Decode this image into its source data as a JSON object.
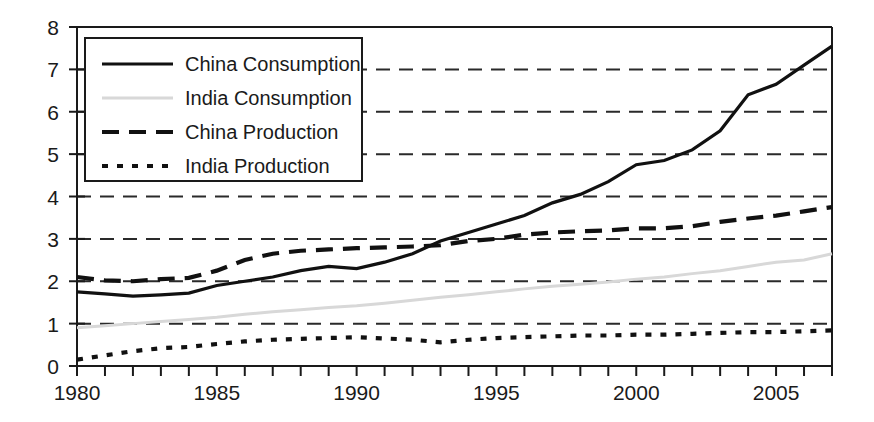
{
  "chart_data": {
    "type": "line",
    "title": "",
    "xlabel": "",
    "ylabel": "",
    "xlim": [
      1980,
      2007
    ],
    "ylim": [
      0,
      8
    ],
    "yticks": [
      0,
      1,
      2,
      3,
      4,
      5,
      6,
      7,
      8
    ],
    "ytick_labels": [
      "0",
      "1",
      "2",
      "3",
      "4",
      "5",
      "6",
      "7",
      "8"
    ],
    "xticks": [
      1980,
      1981,
      1982,
      1983,
      1984,
      1985,
      1986,
      1987,
      1988,
      1989,
      1990,
      1991,
      1992,
      1993,
      1994,
      1995,
      1996,
      1997,
      1998,
      1999,
      2000,
      2001,
      2002,
      2003,
      2004,
      2005,
      2006,
      2007
    ],
    "xtick_labels_shown": [
      "1980",
      "1985",
      "1990",
      "1995",
      "2000",
      "2005"
    ],
    "xtick_labels_shown_at": [
      1980,
      1985,
      1990,
      1995,
      2000,
      2005
    ],
    "grid": true,
    "grid_axis": "y",
    "grid_style": "dashed",
    "legend_position": "upper-left",
    "x": [
      1980,
      1981,
      1982,
      1983,
      1984,
      1985,
      1986,
      1987,
      1988,
      1989,
      1990,
      1991,
      1992,
      1993,
      1994,
      1995,
      1996,
      1997,
      1998,
      1999,
      2000,
      2001,
      2002,
      2003,
      2004,
      2005,
      2006,
      2007
    ],
    "series": [
      {
        "name": "China Consumption",
        "style": "solid",
        "color": "#111111",
        "values": [
          1.75,
          1.7,
          1.65,
          1.68,
          1.72,
          1.9,
          2.0,
          2.1,
          2.25,
          2.35,
          2.3,
          2.45,
          2.65,
          2.95,
          3.15,
          3.35,
          3.55,
          3.85,
          4.05,
          4.35,
          4.75,
          4.85,
          5.1,
          5.55,
          6.4,
          6.65,
          7.1,
          7.55
        ]
      },
      {
        "name": "India Consumption",
        "style": "solid-light",
        "color": "#d8d8d8",
        "values": [
          0.9,
          0.95,
          1.0,
          1.05,
          1.1,
          1.15,
          1.22,
          1.28,
          1.33,
          1.38,
          1.42,
          1.48,
          1.55,
          1.62,
          1.68,
          1.75,
          1.82,
          1.88,
          1.93,
          1.98,
          2.05,
          2.1,
          2.18,
          2.25,
          2.35,
          2.45,
          2.5,
          2.65
        ]
      },
      {
        "name": "China Production",
        "style": "dashed",
        "color": "#111111",
        "values": [
          2.1,
          2.02,
          2.0,
          2.05,
          2.08,
          2.25,
          2.5,
          2.65,
          2.72,
          2.75,
          2.78,
          2.8,
          2.82,
          2.85,
          2.95,
          3.0,
          3.1,
          3.15,
          3.18,
          3.2,
          3.25,
          3.25,
          3.3,
          3.4,
          3.48,
          3.55,
          3.65,
          3.75
        ]
      },
      {
        "name": "India Production",
        "style": "dotted",
        "color": "#111111",
        "values": [
          0.15,
          0.25,
          0.35,
          0.42,
          0.45,
          0.52,
          0.58,
          0.62,
          0.64,
          0.66,
          0.68,
          0.65,
          0.62,
          0.56,
          0.62,
          0.66,
          0.68,
          0.7,
          0.72,
          0.72,
          0.74,
          0.74,
          0.76,
          0.78,
          0.8,
          0.8,
          0.82,
          0.84
        ]
      }
    ]
  },
  "legend": {
    "items": [
      {
        "label": "China Consumption",
        "style": "solid"
      },
      {
        "label": "India Consumption",
        "style": "solid-light"
      },
      {
        "label": "China Production",
        "style": "dashed"
      },
      {
        "label": "India Production",
        "style": "dotted"
      }
    ]
  }
}
